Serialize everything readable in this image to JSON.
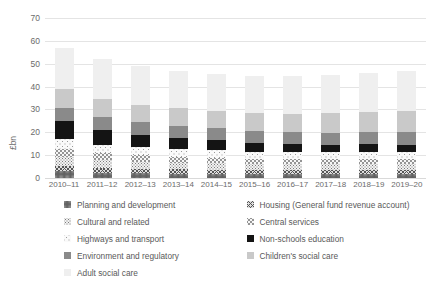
{
  "chart_data": {
    "type": "bar",
    "title": "",
    "xlabel": "",
    "ylabel": "£bn",
    "ylim": [
      0,
      70
    ],
    "ytick_step": 10,
    "yticks": [
      0,
      10,
      20,
      30,
      40,
      50,
      60,
      70
    ],
    "grid": true,
    "stacked": true,
    "legend_position": "bottom",
    "categories": [
      "2010–11",
      "2011–12",
      "2012–13",
      "2013–14",
      "2014–15",
      "2015–16",
      "2016–17",
      "2017–18",
      "2018–19",
      "2019–20"
    ],
    "series": [
      {
        "name": "Planning and development",
        "color": "#e9e9e9",
        "pattern": "dense-dots",
        "values": [
          2.9,
          2.3,
          2.0,
          1.9,
          1.8,
          1.7,
          1.7,
          1.7,
          1.8,
          1.8
        ]
      },
      {
        "name": "Housing (General fund revenue account)",
        "color": "#dedede",
        "pattern": "cross-hatch",
        "values": [
          2.4,
          2.1,
          2.0,
          1.9,
          1.8,
          1.7,
          1.7,
          1.7,
          1.7,
          1.7
        ]
      },
      {
        "name": "Cultural and related",
        "color": "#f2f2f2",
        "pattern": "medium-dots",
        "values": [
          4.0,
          3.5,
          3.2,
          3.0,
          2.8,
          2.7,
          2.6,
          2.6,
          2.6,
          2.6
        ]
      },
      {
        "name": "Central services",
        "color": "#f7f7f7",
        "pattern": "sparse-dots",
        "values": [
          3.5,
          3.0,
          2.7,
          2.5,
          2.4,
          2.3,
          2.2,
          2.2,
          2.2,
          2.2
        ]
      },
      {
        "name": "Highways and transport",
        "color": "#fafafa",
        "pattern": "fine-dots",
        "values": [
          4.2,
          3.7,
          3.5,
          3.4,
          3.3,
          3.2,
          3.1,
          3.1,
          3.2,
          3.2
        ]
      },
      {
        "name": "Non-schools education",
        "color": "#141414",
        "pattern": "solid-black",
        "values": [
          7.9,
          6.4,
          5.6,
          5.0,
          4.5,
          3.9,
          3.5,
          3.3,
          3.2,
          3.1
        ]
      },
      {
        "name": "Environment and regulatory",
        "color": "#8a8a8a",
        "pattern": "solid-dark-grey",
        "values": [
          5.9,
          5.6,
          5.4,
          5.3,
          5.2,
          5.2,
          5.2,
          5.3,
          5.4,
          5.5
        ]
      },
      {
        "name": "Children's social care",
        "color": "#c9c9c9",
        "pattern": "solid-mid-grey",
        "values": [
          8.0,
          7.9,
          7.6,
          7.5,
          7.6,
          7.8,
          8.1,
          8.5,
          8.8,
          9.2
        ]
      },
      {
        "name": "Adult social care",
        "color": "#efefef",
        "pattern": "solid-light-grey",
        "values": [
          18.2,
          17.5,
          17.0,
          16.5,
          16.1,
          16.2,
          16.4,
          16.8,
          17.1,
          17.5
        ]
      }
    ],
    "totals": [
      57.0,
      52.0,
      49.0,
      47.0,
      45.5,
      44.7,
      44.5,
      45.2,
      46.0,
      46.8
    ]
  },
  "axis": {
    "y_title": "£bn"
  }
}
